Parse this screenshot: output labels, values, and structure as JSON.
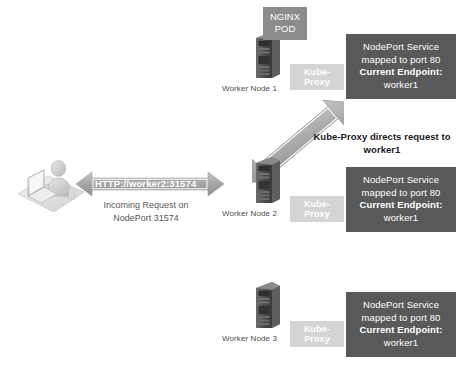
{
  "diagram": {
    "colors": {
      "nodeport_box_bg": "#595959",
      "kube_proxy_bg": "#d4d4d4",
      "nginx_pod_bg": "#8c8c8c",
      "arrow_fill": "#a6a6a6",
      "background": "#ffffff",
      "caption_text": "#4d4d4d"
    },
    "client": {
      "icon": "user-at-desk-icon",
      "arrow": {
        "icon": "double-headed-horizontal-arrow-icon",
        "label": "HTTP://worker2:31574"
      },
      "caption_line1": "Incoming Request on",
      "caption_line2": "NodePort 31574"
    },
    "routing_note": {
      "line1": "Kube-Proxy directs request to",
      "line2": "worker1"
    },
    "redirect_arrow": {
      "icon": "double-headed-diagonal-arrow-icon"
    },
    "pod": {
      "line1": "NGINX",
      "line2": "POD"
    },
    "nodes": [
      {
        "caption": "Worker Node 1",
        "icon": "server-tower-icon",
        "kube_proxy_label": "Kube-Proxy",
        "service": {
          "line1": "NodePort Service",
          "line2": "mapped to port 80",
          "line3": "Current Endpoint:",
          "line4": "worker1"
        },
        "has_pod": true
      },
      {
        "caption": "Worker Node 2",
        "icon": "server-tower-icon",
        "kube_proxy_label": "Kube-Proxy",
        "service": {
          "line1": "NodePort Service",
          "line2": "mapped to port 80",
          "line3": "Current Endpoint:",
          "line4": "worker1"
        },
        "has_pod": false
      },
      {
        "caption": "Worker Node 3",
        "icon": "server-tower-icon",
        "kube_proxy_label": "Kube-Proxy",
        "service": {
          "line1": "NodePort Service",
          "line2": "mapped to port 80",
          "line3": "Current Endpoint:",
          "line4": "worker1"
        },
        "has_pod": false
      }
    ]
  }
}
